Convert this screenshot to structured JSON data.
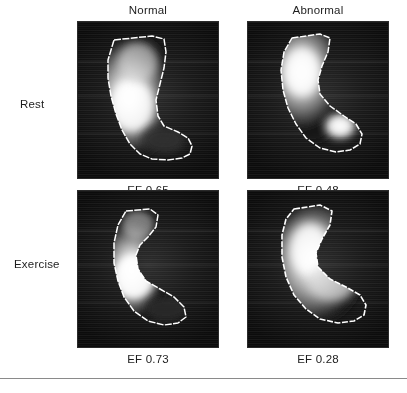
{
  "figure": {
    "type": "radionuclide-ventriculography-panel-grid",
    "columns": [
      {
        "id": "normal",
        "label": "Normal"
      },
      {
        "id": "abnormal",
        "label": "Abnormal"
      }
    ],
    "rows": [
      {
        "id": "rest",
        "label": "Rest"
      },
      {
        "id": "exercise",
        "label": "Exercise"
      }
    ],
    "panels": [
      {
        "id": "rest-normal",
        "row": "Rest",
        "column": "Normal",
        "caption": "EF 0.65",
        "ef_value": 0.65,
        "modality": "gated-blood-pool-scan",
        "contour": "left-ventricular-outline"
      },
      {
        "id": "rest-abnormal",
        "row": "Rest",
        "column": "Abnormal",
        "caption": "EF 0.48",
        "ef_value": 0.48,
        "modality": "gated-blood-pool-scan",
        "contour": "left-ventricular-outline"
      },
      {
        "id": "exercise-normal",
        "row": "Exercise",
        "column": "Normal",
        "caption": "EF 0.73",
        "ef_value": 0.73,
        "modality": "gated-blood-pool-scan",
        "contour": "left-ventricular-outline"
      },
      {
        "id": "exercise-abnormal",
        "row": "Exercise",
        "column": "Abnormal",
        "caption": "EF 0.28",
        "ef_value": 0.28,
        "modality": "gated-blood-pool-scan",
        "contour": "left-ventricular-outline"
      }
    ],
    "colors": {
      "background": "#ffffff",
      "text": "#1d1d1d",
      "panel_dark": "#101010",
      "contour_stroke": "#ffffff",
      "rule": "#8a8a8a"
    }
  }
}
